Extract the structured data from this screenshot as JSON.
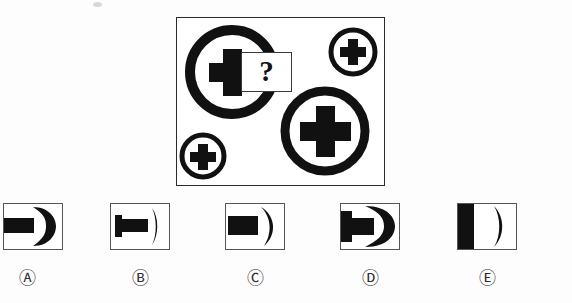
{
  "puzzle": {
    "type": "visual-analogy-matrix",
    "question_mark": "?",
    "panel": {
      "border_color": "#2b2b2b",
      "background": "#ffffff",
      "x": 176,
      "y": 17,
      "width": 209,
      "height": 169
    },
    "figures": [
      {
        "name": "large-circle-cross-top-left",
        "shape": "circle-with-cross",
        "cx": 232,
        "cy": 72,
        "radius": 47,
        "ring_width": 10,
        "cross_size": 46,
        "cross_arm": 15,
        "color": "#111111"
      },
      {
        "name": "small-circle-cross-top-right",
        "shape": "circle-with-cross",
        "cx": 353,
        "cy": 52,
        "radius": 25,
        "ring_width": 5,
        "cross_size": 26,
        "cross_arm": 8,
        "color": "#111111"
      },
      {
        "name": "large-circle-cross-bottom-right",
        "shape": "circle-with-cross",
        "cx": 325,
        "cy": 131,
        "radius": 45,
        "ring_width": 9,
        "cross_size": 50,
        "cross_arm": 16,
        "color": "#111111"
      },
      {
        "name": "small-circle-cross-bottom-left",
        "shape": "circle-with-cross",
        "cx": 203,
        "cy": 156,
        "radius": 24,
        "ring_width": 5,
        "cross_size": 25,
        "cross_arm": 8,
        "color": "#111111"
      }
    ]
  },
  "options": [
    {
      "id": "A",
      "label": "Ⓐ",
      "x": 3,
      "label_x": 7,
      "description": "horizontal black bar at left, thick left-opening crescent at right",
      "shapes": {
        "bar": {
          "x": 0,
          "y": 15,
          "width": 30,
          "height": 15
        },
        "crescent": {
          "side": "left-open",
          "thickness": "thick"
        }
      }
    },
    {
      "id": "B",
      "label": "Ⓑ",
      "x": 110,
      "label_x": 120,
      "description": "black plug/stem shape at left, thin vertical arc at right",
      "shapes": {
        "bar": {
          "x": 5,
          "y": 16,
          "width": 32,
          "height": 13
        },
        "stem": {
          "x": 5,
          "y": 12,
          "width": 7,
          "height": 21
        },
        "crescent": {
          "side": "right-open",
          "thickness": "thin"
        }
      }
    },
    {
      "id": "C",
      "label": "Ⓒ",
      "x": 225,
      "label_x": 235,
      "description": "black rectangle at left, right-opening crescent at right",
      "shapes": {
        "bar": {
          "x": 2,
          "y": 13,
          "width": 30,
          "height": 19
        },
        "crescent": {
          "side": "right-open",
          "thickness": "medium"
        }
      }
    },
    {
      "id": "D",
      "label": "Ⓓ",
      "x": 340,
      "label_x": 350,
      "description": "filled black plug/cross-stem joined to a thick right-opening crescent",
      "shapes": {
        "bar": {
          "x": 0,
          "y": 15,
          "width": 33,
          "height": 16
        },
        "stem": {
          "x": 0,
          "y": 9,
          "width": 10,
          "height": 29
        },
        "crescent": {
          "side": "right-open",
          "thickness": "thick"
        }
      }
    },
    {
      "id": "E",
      "label": "Ⓔ",
      "x": 457,
      "label_x": 467,
      "description": "thick vertical black bar at left edge, thin right-opening crescent at right",
      "shapes": {
        "bar": {
          "x": 0,
          "y": 0,
          "width": 16,
          "height": 47
        },
        "crescent": {
          "side": "right-open",
          "thickness": "thin"
        }
      }
    }
  ],
  "colors": {
    "ink": "#111111",
    "panel_border": "#2b2b2b",
    "option_border": "#555555",
    "background": "#fdfdfd",
    "label_text": "#2e2e2e"
  }
}
